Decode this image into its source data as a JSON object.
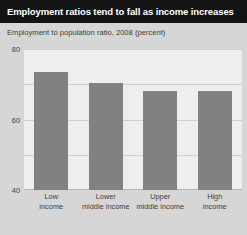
{
  "title": "Employment ratios tend to fall as income increases",
  "subtitle": "Employment to population ratio, 2008 (percent)",
  "colors": {
    "title_bar": "#141414",
    "title_text": "#ffffff",
    "page_background": "#d6d6d6",
    "plot_background": "#eeeeee",
    "bar_fill": "#818181",
    "gridline": "#cfcfcf",
    "axis_text": "#3d3d3d"
  },
  "chart_data": {
    "type": "bar",
    "title": "Employment ratios tend to fall as income increases",
    "subtitle": "Employment to population ratio, 2008 (percent)",
    "categories": [
      "Low income",
      "Lower middle income",
      "Upper middle income",
      "High income"
    ],
    "category_lines": [
      [
        "Low",
        "income"
      ],
      [
        "Lower",
        "middle income"
      ],
      [
        "Upper",
        "middle income"
      ],
      [
        "High",
        "income"
      ]
    ],
    "values": [
      67,
      61,
      56,
      56
    ],
    "xlabel": "",
    "ylabel": "",
    "ylim": [
      0,
      80
    ],
    "yticks": [
      80,
      60,
      40,
      20,
      0
    ],
    "ytick_labels": [
      "80",
      "60",
      "40",
      "20",
      "0"
    ],
    "grid": true,
    "legend": false,
    "series": [
      {
        "name": "Employment to population ratio, 2008 (percent)",
        "values": [
          67,
          61,
          56,
          56
        ]
      }
    ]
  }
}
